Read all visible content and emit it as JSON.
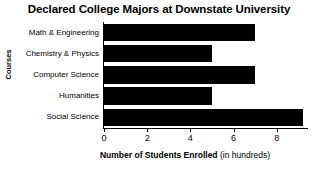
{
  "chart_data": {
    "type": "bar",
    "orientation": "horizontal",
    "title": "Declared College Majors at Downstate University",
    "xlabel_bold": "Number of Students Enrolled",
    "xlabel_light": "(in hundreds)",
    "ylabel": "Courses",
    "categories": [
      "Math & Engineering",
      "Chemistry & Physics",
      "Computer Science",
      "Humanities",
      "Social Science"
    ],
    "values": [
      7,
      5,
      7,
      5,
      9.2
    ],
    "xticks": [
      0,
      2,
      4,
      6,
      8
    ],
    "xtick_labels": [
      "0",
      "2",
      "4",
      "6",
      "8"
    ],
    "xlim": [
      0,
      9.4
    ],
    "grid": false,
    "legend": false,
    "bar_color": "#000000",
    "background_color": "#ffffff",
    "axis_color": "#000000"
  }
}
